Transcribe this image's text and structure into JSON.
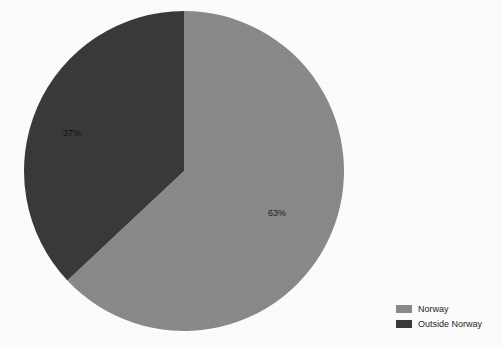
{
  "chart_data": {
    "type": "pie",
    "title": "",
    "subtitle": "",
    "xlabel": "",
    "ylabel": "",
    "grid": false,
    "legend_position": "bottom-right",
    "categories": [
      "Norway",
      "Outside Norway"
    ],
    "values": [
      63,
      37
    ],
    "unit": "%",
    "start_angle_deg": 0,
    "direction": "clockwise",
    "slices": [
      {
        "label": "Norway",
        "value": 63,
        "value_label": "63%",
        "color": "#8a8a8a",
        "label_color": "#1c1c1c"
      },
      {
        "label": "Outside Norway",
        "value": 37,
        "value_label": "37%",
        "color": "#3a3a3a",
        "label_color": "#121212"
      }
    ],
    "geometry": {
      "center_x": 184,
      "center_y": 171,
      "radius": 160
    },
    "background_color": "#fdfdfd"
  },
  "legend": {
    "items": [
      {
        "label": "Norway",
        "color": "#8a8a8a"
      },
      {
        "label": "Outside Norway",
        "color": "#3a3a3a"
      }
    ]
  }
}
